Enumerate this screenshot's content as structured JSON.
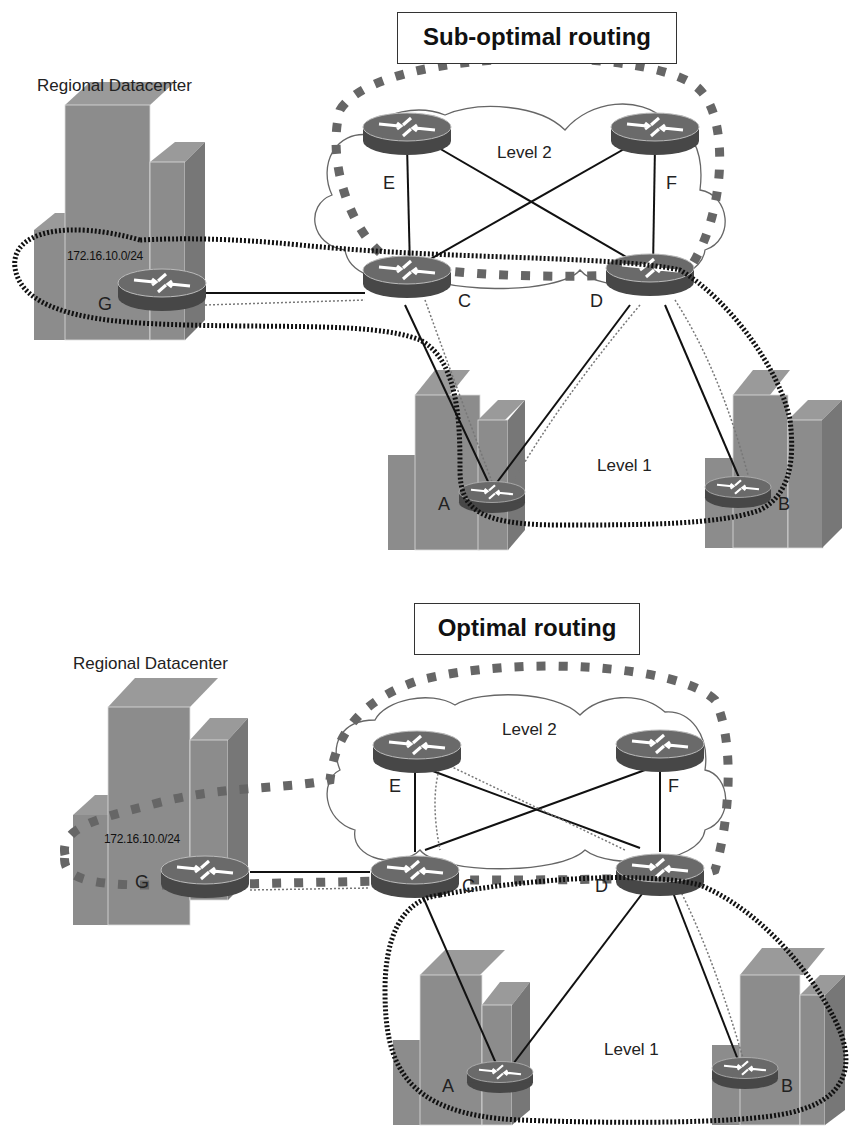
{
  "panels": [
    {
      "id": "top",
      "title": "Sub-optimal routing",
      "datacenter_label": "Regional Datacenter",
      "network_label": "172.16.10.0/24",
      "level2_label": "Level 2",
      "level1_label": "Level 1",
      "routers": {
        "A": "A",
        "B": "B",
        "C": "C",
        "D": "D",
        "E": "E",
        "F": "F",
        "G": "G"
      }
    },
    {
      "id": "bottom",
      "title": "Optimal routing",
      "datacenter_label": "Regional Datacenter",
      "network_label": "172.16.10.0/24",
      "level2_label": "Level 2",
      "level1_label": "Level 1",
      "routers": {
        "A": "A",
        "B": "B",
        "C": "C",
        "D": "D",
        "E": "E",
        "F": "F",
        "G": "G"
      }
    }
  ],
  "colors": {
    "building": "#8a8a8a",
    "router_top": "#6e6e6e",
    "router_side": "#4a4a4a",
    "line": "#111111",
    "dashed_area": "#555555"
  }
}
